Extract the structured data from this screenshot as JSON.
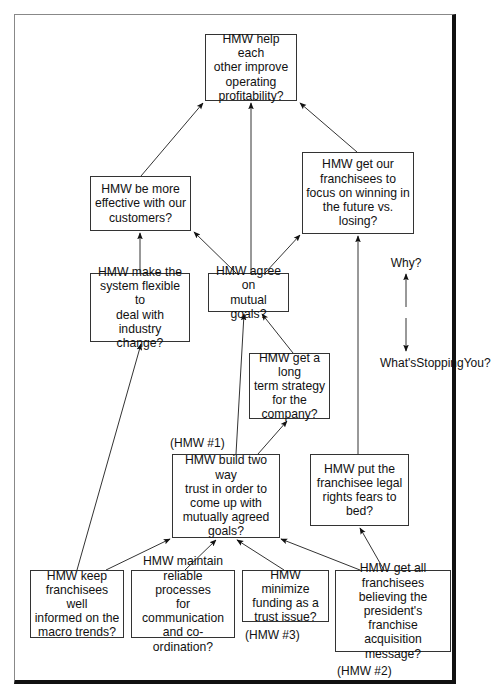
{
  "diagram": {
    "type": "why-whats-stopping-you ladder",
    "nodes": [
      {
        "id": "n1",
        "text": "HMW help each other improve operating profitability?"
      },
      {
        "id": "n2",
        "text": "HMW be more effective with our customers?"
      },
      {
        "id": "n3",
        "text": "HMW get our franchisees to focus on winning in the future vs. losing?"
      },
      {
        "id": "n4",
        "text": "HMW make the system flexible to deal with industry change?"
      },
      {
        "id": "n5",
        "text": "HMW agree on mutual goals?"
      },
      {
        "id": "n6",
        "text": "HMW get a long term strategy for the company?"
      },
      {
        "id": "n7",
        "text": "HMW build two way trust in order to come up with mutually agreed goals?"
      },
      {
        "id": "n8",
        "text": "HMW put the franchisee legal rights fears to bed?"
      },
      {
        "id": "n9",
        "text": "HMW keep franchisees well informed on the macro trends?"
      },
      {
        "id": "n10",
        "text": "HMW maintain reliable processes for communication and co-ordination?"
      },
      {
        "id": "n11",
        "text": "HMW minimize funding as a trust issue?"
      },
      {
        "id": "n12",
        "text": "HMW get all franchisees believing the president's franchise acquisition message?"
      }
    ],
    "edges": [
      {
        "from": "n2",
        "to": "n1"
      },
      {
        "from": "n5",
        "to": "n1"
      },
      {
        "from": "n3",
        "to": "n1"
      },
      {
        "from": "n4",
        "to": "n2"
      },
      {
        "from": "n5",
        "to": "n2"
      },
      {
        "from": "n5",
        "to": "n3"
      },
      {
        "from": "n6",
        "to": "n5"
      },
      {
        "from": "n7",
        "to": "n5"
      },
      {
        "from": "n7",
        "to": "n6"
      },
      {
        "from": "n8",
        "to": "n3"
      },
      {
        "from": "n9",
        "to": "n4"
      },
      {
        "from": "n9",
        "to": "n7"
      },
      {
        "from": "n10",
        "to": "n7"
      },
      {
        "from": "n11",
        "to": "n7"
      },
      {
        "from": "n12",
        "to": "n7"
      },
      {
        "from": "n12",
        "to": "n8"
      }
    ],
    "annotations": {
      "hmw1": "(HMW #1)",
      "hmw2": "(HMW #2)",
      "hmw3": "(HMW #3)"
    },
    "legend": {
      "up_label": "Why?",
      "down_label": "What's Stopping You?"
    }
  },
  "lines": {
    "n1": [
      "HMW help each",
      "other improve",
      "operating",
      "profitability?"
    ],
    "n2": [
      "HMW be more",
      "effective with our",
      "customers?"
    ],
    "n3": [
      "HMW get our",
      "franchisees to",
      "focus on winning in",
      "the future vs.",
      "losing?"
    ],
    "n4": [
      "HMW make the",
      "system flexible to",
      "deal with industry",
      "change?"
    ],
    "n5": [
      "HMW agree on",
      "mutual goals?"
    ],
    "n6": [
      "HMW get a long",
      "term strategy",
      "for the",
      "company?"
    ],
    "n7": [
      "HMW build two way",
      "trust in order to",
      "come up with",
      "mutually agreed",
      "goals?"
    ],
    "n8": [
      "HMW put the",
      "franchisee legal",
      "rights fears to",
      "bed?"
    ],
    "n9": [
      "HMW keep",
      "franchisees well",
      "informed on the",
      "macro trends?"
    ],
    "n10": [
      "HMW maintain",
      "reliable processes",
      "for communication",
      "and co-ordination?"
    ],
    "n11": [
      "HMW minimize",
      "funding as a",
      "trust issue?"
    ],
    "n12": [
      "HMW get all",
      "franchisees",
      "believing the",
      "president's franchise",
      "acquisition message?"
    ],
    "legend_down": [
      "What's",
      "Stopping",
      "You?"
    ]
  }
}
